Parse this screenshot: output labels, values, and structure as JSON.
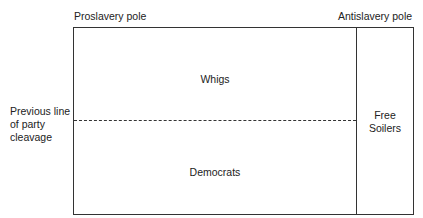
{
  "diagram": {
    "top_left_label": "Proslavery pole",
    "top_right_label": "Antislavery pole",
    "side_label": [
      "Previous line",
      "of party",
      "cleavage"
    ],
    "upper_region": "Whigs",
    "lower_region": "Democrats",
    "right_region": [
      "Free",
      "Soilers"
    ]
  }
}
